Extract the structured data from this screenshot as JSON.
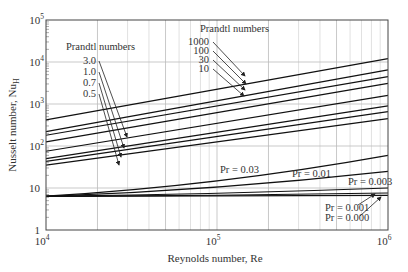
{
  "chart_data": {
    "type": "line",
    "title": "",
    "xlabel": "Reynolds number, Re",
    "ylabel": "Nusselt number, Nu_H",
    "xscale": "log",
    "yscale": "log",
    "xlim": [
      10000,
      1000000
    ],
    "ylim": [
      1,
      100000
    ],
    "grid": true,
    "x_ticks": [
      {
        "base": "10",
        "exp": "4"
      },
      {
        "base": "10",
        "exp": "5"
      },
      {
        "base": "10",
        "exp": "6"
      }
    ],
    "y_ticks": [
      {
        "text": "1",
        "exp": ""
      },
      {
        "text": "10",
        "exp": ""
      },
      {
        "text": "10",
        "exp": "2"
      },
      {
        "text": "10",
        "exp": "3"
      },
      {
        "text": "10",
        "exp": "4"
      },
      {
        "text": "10",
        "exp": "5"
      }
    ],
    "x": [
      10000,
      1000000
    ],
    "series": [
      {
        "name": "Pr = 1000",
        "values": [
          420,
          12000
        ]
      },
      {
        "name": "Pr = 100",
        "values": [
          220,
          6500
        ]
      },
      {
        "name": "Pr = 30",
        "values": [
          180,
          4500
        ]
      },
      {
        "name": "Pr = 10",
        "values": [
          125,
          3100
        ]
      },
      {
        "name": "Pr = 3.0",
        "values": [
          75,
          1600
        ]
      },
      {
        "name": "Pr = 1.0",
        "values": [
          50,
          900
        ]
      },
      {
        "name": "Pr = 0.7",
        "values": [
          43,
          660
        ]
      },
      {
        "name": "Pr = 0.5",
        "values": [
          35,
          450
        ]
      },
      {
        "name": "Pr = 0.03",
        "values": [
          6.4,
          60
        ]
      },
      {
        "name": "Pr = 0.01",
        "values": [
          6.3,
          25
        ]
      },
      {
        "name": "Pr = 0.003",
        "values": [
          6.3,
          10
        ]
      },
      {
        "name": "Pr = 0.001",
        "values": [
          6.3,
          7.6
        ]
      },
      {
        "name": "Pr = 0.000",
        "values": [
          6.3,
          6.7
        ]
      }
    ],
    "annotations": {
      "group_left_title": "Prandtl numbers",
      "group_left": [
        "3.0",
        "1.0",
        "0.7",
        "0.5"
      ],
      "group_right_title": "Prandtl numbers",
      "group_right": [
        "1000",
        "100",
        "30",
        "10"
      ],
      "inline": [
        "Pr = 0.03",
        "Pr = 0.01",
        "Pr = 0.003",
        "Pr = 0.001",
        "Pr = 0.000"
      ]
    }
  }
}
